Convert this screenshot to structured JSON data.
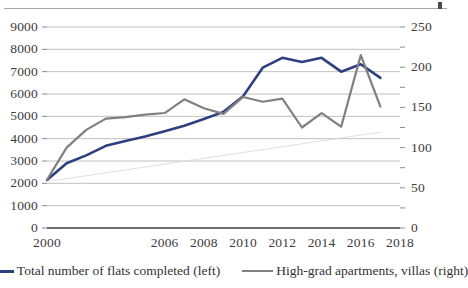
{
  "chart_data": {
    "type": "line",
    "title": "",
    "subtitle": "",
    "xlabel": "",
    "ylabel": "",
    "grid": true,
    "legend_position": "bottom",
    "x": [
      2000,
      2001,
      2002,
      2003,
      2004,
      2005,
      2006,
      2007,
      2008,
      2009,
      2010,
      2011,
      2012,
      2013,
      2014,
      2015,
      2016,
      2017
    ],
    "x_tick_labels": [
      "2000",
      "2006",
      "2008",
      "2010",
      "2012",
      "2014",
      "2016",
      "2018"
    ],
    "x_tick_values": [
      2000,
      2006,
      2008,
      2010,
      2012,
      2014,
      2016,
      2018
    ],
    "xlim": [
      2000,
      2018
    ],
    "axes": [
      {
        "id": "left",
        "label": "",
        "ylim": [
          0,
          9000
        ],
        "ticks": [
          0,
          1000,
          2000,
          3000,
          4000,
          5000,
          6000,
          7000,
          8000,
          9000
        ],
        "tick_labels": [
          "0",
          "1000",
          "2000",
          "3000",
          "4000",
          "5000",
          "6000",
          "7000",
          "8000",
          "9000"
        ]
      },
      {
        "id": "right",
        "label": "",
        "ylim": [
          0,
          250
        ],
        "ticks": [
          0,
          25,
          50,
          75,
          100,
          125,
          150,
          175,
          200,
          225,
          250
        ],
        "tick_labels": [
          "0",
          "",
          "50",
          "",
          "100",
          "",
          "150",
          "",
          "200",
          "",
          "250"
        ]
      }
    ],
    "series": [
      {
        "name": "Total number of flats completed (left)",
        "axis": "left",
        "color": "#2e3f80",
        "width": 2.6,
        "values": [
          2150,
          2900,
          3250,
          3680,
          3900,
          4100,
          4330,
          4580,
          4880,
          5200,
          5900,
          7180,
          7620,
          7430,
          7620,
          7000,
          7330,
          6720
        ]
      },
      {
        "name": "High-grad apartments, villas (right)",
        "axis": "right",
        "color": "#808080",
        "width": 2.2,
        "values": [
          60,
          100,
          122,
          136,
          138,
          141,
          143,
          160,
          149,
          142,
          163,
          157,
          161,
          125,
          143,
          126,
          215,
          151
        ]
      },
      {
        "name": "trendline",
        "axis": "left",
        "color": "#d8d8d8",
        "width": 0.8,
        "hidden_from_legend": true,
        "values": [
          2080,
          2210,
          2340,
          2470,
          2600,
          2730,
          2860,
          2990,
          3120,
          3250,
          3380,
          3510,
          3640,
          3770,
          3900,
          4030,
          4160,
          4290
        ]
      }
    ]
  },
  "legend": {
    "items": [
      {
        "label": "Total number of flats completed (left)",
        "color": "#2e3f80"
      },
      {
        "label": "High-grad apartments, villas (right)",
        "color": "#808080"
      }
    ]
  }
}
